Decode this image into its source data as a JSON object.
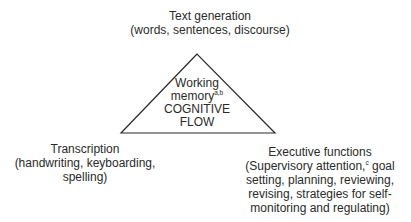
{
  "diagram": {
    "type": "triangle-model",
    "colors": {
      "line": "#2a2a2a",
      "text": "#2a2a2a",
      "background": "#ffffff"
    },
    "top": {
      "title": "Text generation",
      "detail": "(words, sentences, discourse)"
    },
    "center": {
      "line1": "Working",
      "line2": "memory",
      "line2_sup": "a,b",
      "line3": "COGNITIVE",
      "line4": "FLOW"
    },
    "left": {
      "title": "Transcription",
      "line1": "(handwriting, keyboarding,",
      "line2": "spelling)"
    },
    "right": {
      "title": "Executive functions",
      "line1_a": "(Supervisory attention,",
      "line1_sup": "c",
      "line1_b": " goal",
      "line2": "setting, planning, reviewing,",
      "line3": "revising, strategies for self-",
      "line4": "monitoring and regulating)"
    }
  }
}
